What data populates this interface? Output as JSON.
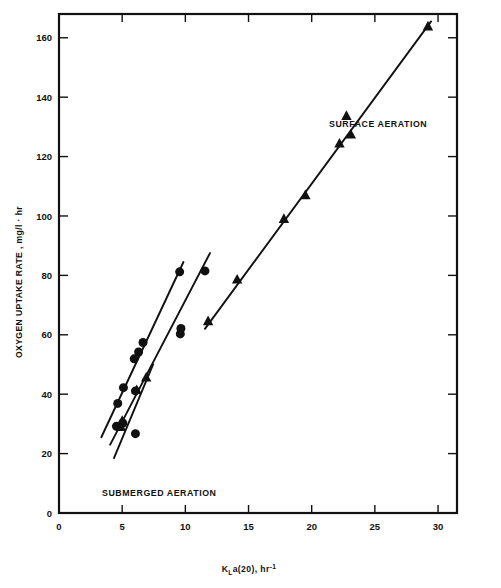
{
  "figure": {
    "background_color": "#ffffff",
    "ink_color": "#111111",
    "width": 501,
    "height": 588
  },
  "annotations": {
    "surface_aeration_label": "SURFACE AERATION",
    "submerged_aeration_label": "SUBMERGED AERATION"
  },
  "axis_titles": {
    "y": "OXYGEN UPTAKE RATE , mg/l · hr",
    "x_main": "K",
    "x_sub": "L",
    "x_mid": "a(20), hr",
    "x_sup": "-1"
  },
  "chart_data": {
    "type": "scatter",
    "title": "",
    "subtitle": "",
    "xlabel": "K_L a(20), hr^-1",
    "ylabel": "OXYGEN UPTAKE RATE , mg/l · hr",
    "xlim": [
      0,
      31.5
    ],
    "ylim": [
      0,
      168
    ],
    "xticks": [
      0,
      5,
      10,
      15,
      20,
      25,
      30
    ],
    "yticks": [
      0,
      20,
      40,
      60,
      80,
      100,
      120,
      140,
      160
    ],
    "xticklabels": [
      "0",
      "5",
      "10",
      "15",
      "20",
      "25",
      "30"
    ],
    "yticklabels": [
      "0",
      "20",
      "40",
      "60",
      "80",
      "100",
      "120",
      "140",
      "160"
    ],
    "grid": false,
    "legend_position": "inline-annotation",
    "series": [
      {
        "name": "Submerged aeration - set A",
        "marker": "circle",
        "group": "submerged",
        "points": [
          {
            "x": 4.55,
            "y": 29.2
          },
          {
            "x": 4.65,
            "y": 36.9
          },
          {
            "x": 5.1,
            "y": 42.2
          },
          {
            "x": 5.95,
            "y": 51.9
          },
          {
            "x": 6.3,
            "y": 54.2
          },
          {
            "x": 6.65,
            "y": 57.4
          },
          {
            "x": 9.55,
            "y": 81.2
          }
        ],
        "fit_line": {
          "x1": 3.35,
          "y1": 25.5,
          "x2": 9.85,
          "y2": 84.5
        }
      },
      {
        "name": "Submerged aeration - set B",
        "marker": "circle",
        "group": "submerged",
        "points": [
          {
            "x": 5.05,
            "y": 30.3
          },
          {
            "x": 6.05,
            "y": 41.1
          },
          {
            "x": 9.6,
            "y": 60.3
          },
          {
            "x": 9.65,
            "y": 62.1
          },
          {
            "x": 11.55,
            "y": 81.5
          }
        ],
        "fit_line": {
          "x1": 4.05,
          "y1": 23.0,
          "x2": 11.95,
          "y2": 87.5
        }
      },
      {
        "name": "Submerged aeration - set C",
        "marker": "triangle",
        "group": "submerged",
        "points": [
          {
            "x": 4.9,
            "y": 29.0
          },
          {
            "x": 5.0,
            "y": 31.0
          },
          {
            "x": 6.15,
            "y": 41.4
          },
          {
            "x": 6.9,
            "y": 45.6
          }
        ],
        "fit_line": {
          "x1": 4.35,
          "y1": 18.5,
          "x2": 7.45,
          "y2": 50.0
        }
      },
      {
        "name": "Submerged aeration - set D",
        "marker": "circle",
        "group": "submerged",
        "points": [
          {
            "x": 6.05,
            "y": 26.7
          }
        ],
        "fit_line": null
      },
      {
        "name": "Surface aeration",
        "marker": "triangle",
        "group": "surface",
        "points": [
          {
            "x": 11.8,
            "y": 64.6
          },
          {
            "x": 14.1,
            "y": 78.6
          },
          {
            "x": 17.8,
            "y": 99.0
          },
          {
            "x": 19.5,
            "y": 107.0
          },
          {
            "x": 22.2,
            "y": 124.4
          },
          {
            "x": 22.75,
            "y": 133.7
          },
          {
            "x": 23.1,
            "y": 127.4
          },
          {
            "x": 29.2,
            "y": 163.8
          }
        ],
        "fit_line": {
          "x1": 11.55,
          "y1": 62.0,
          "x2": 29.45,
          "y2": 165.5
        }
      }
    ]
  }
}
